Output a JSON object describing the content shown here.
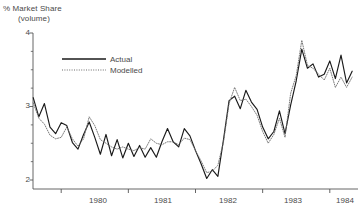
{
  "chart_data": {
    "type": "line",
    "title": "% Market Share",
    "subtitle": "(volume)",
    "xlabel": "",
    "ylabel": "% Market Share (volume)",
    "ylim": [
      2,
      4
    ],
    "xlim": [
      1979.58,
      1984.42
    ],
    "grid": false,
    "legend_position": "top-left-inside",
    "y_ticks": [
      "4",
      "3",
      "2"
    ],
    "y_tick_values": [
      4,
      3,
      2
    ],
    "y_minor_tick_values": [
      3.75,
      3.5,
      3.25,
      2.75,
      2.5,
      2.25
    ],
    "x_ticks": [
      "1980",
      "1981",
      "1982",
      "1983",
      "1984"
    ],
    "x_tick_boundaries": [
      1980,
      1981,
      1982,
      1983,
      1984
    ],
    "x_label_positions": [
      1980.5,
      1981.5,
      1982.5,
      1983.5,
      1984.2
    ],
    "series": [
      {
        "name": "Actual",
        "style": "solid",
        "color": "#1a1a1a",
        "x": [
          1979.583,
          1979.667,
          1979.75,
          1979.833,
          1979.917,
          1980.0,
          1980.083,
          1980.167,
          1980.25,
          1980.333,
          1980.417,
          1980.5,
          1980.583,
          1980.667,
          1980.75,
          1980.833,
          1980.917,
          1981.0,
          1981.083,
          1981.167,
          1981.25,
          1981.333,
          1981.417,
          1981.5,
          1981.583,
          1981.667,
          1981.75,
          1981.833,
          1981.917,
          1982.0,
          1982.083,
          1982.167,
          1982.25,
          1982.333,
          1982.417,
          1982.5,
          1982.583,
          1982.667,
          1982.75,
          1982.833,
          1982.917,
          1983.0,
          1983.083,
          1983.167,
          1983.25,
          1983.333,
          1983.417,
          1983.5,
          1983.583,
          1983.667,
          1983.75,
          1983.833,
          1983.917,
          1984.0,
          1984.083,
          1984.167,
          1984.25,
          1984.333
        ],
        "values": [
          3.12,
          2.86,
          3.04,
          2.72,
          2.63,
          2.78,
          2.74,
          2.51,
          2.42,
          2.62,
          2.79,
          2.58,
          2.35,
          2.62,
          2.33,
          2.55,
          2.3,
          2.5,
          2.32,
          2.47,
          2.31,
          2.44,
          2.31,
          2.52,
          2.7,
          2.52,
          2.45,
          2.7,
          2.6,
          2.4,
          2.22,
          2.02,
          2.14,
          2.05,
          2.55,
          3.08,
          3.14,
          2.97,
          3.22,
          3.06,
          2.96,
          2.72,
          2.56,
          2.66,
          2.94,
          2.63,
          3.02,
          3.35,
          3.78,
          3.52,
          3.58,
          3.4,
          3.44,
          3.62,
          3.38,
          3.7,
          3.32,
          3.48
        ]
      },
      {
        "name": "Modelled",
        "style": "dotted",
        "color": "#6b6b6b",
        "x": [
          1979.583,
          1979.667,
          1979.75,
          1979.833,
          1979.917,
          1980.0,
          1980.083,
          1980.167,
          1980.25,
          1980.333,
          1980.417,
          1980.5,
          1980.583,
          1980.667,
          1980.75,
          1980.833,
          1980.917,
          1981.0,
          1981.083,
          1981.167,
          1981.25,
          1981.333,
          1981.417,
          1981.5,
          1981.583,
          1981.667,
          1981.75,
          1981.833,
          1981.917,
          1982.0,
          1982.083,
          1982.167,
          1982.25,
          1982.333,
          1982.417,
          1982.5,
          1982.583,
          1982.667,
          1982.75,
          1982.833,
          1982.917,
          1983.0,
          1983.083,
          1983.167,
          1983.25,
          1983.333,
          1983.417,
          1983.5,
          1983.583,
          1983.667,
          1983.75,
          1983.833,
          1983.917,
          1984.0,
          1984.083,
          1984.167,
          1984.25,
          1984.333
        ],
        "values": [
          3.05,
          2.84,
          2.76,
          2.61,
          2.56,
          2.58,
          2.72,
          2.56,
          2.46,
          2.56,
          2.86,
          2.74,
          2.55,
          2.5,
          2.45,
          2.42,
          2.45,
          2.42,
          2.4,
          2.44,
          2.42,
          2.56,
          2.5,
          2.48,
          2.52,
          2.52,
          2.48,
          2.57,
          2.55,
          2.4,
          2.26,
          2.1,
          2.12,
          2.2,
          2.52,
          3.04,
          3.26,
          3.08,
          3.1,
          3.0,
          2.88,
          2.66,
          2.5,
          2.62,
          2.84,
          2.58,
          3.18,
          3.42,
          3.9,
          3.56,
          3.52,
          3.44,
          3.36,
          3.52,
          3.26,
          3.4,
          3.26,
          3.4
        ]
      }
    ]
  },
  "legend": {
    "entries": [
      {
        "label": "Actual"
      },
      {
        "label": "Modelled"
      }
    ]
  }
}
